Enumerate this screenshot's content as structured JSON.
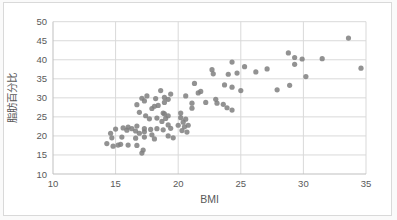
{
  "window": {
    "background": "#ffffff",
    "frame_border_color": "#d9d9d9"
  },
  "chart_data": {
    "type": "scatter",
    "title": "",
    "xlabel": "BMI",
    "ylabel": "脂肪百分比",
    "xlim": [
      10,
      35
    ],
    "ylim": [
      10,
      50
    ],
    "x_ticks": [
      10,
      15,
      20,
      25,
      30,
      35
    ],
    "y_ticks": [
      10,
      15,
      20,
      25,
      30,
      35,
      40,
      45,
      50
    ],
    "grid": true,
    "legend_position": "none",
    "marker": "circle",
    "point_color": "#7f7f7f",
    "gridline_color": "#d9d9d9",
    "axis_line_color": "#bfbfbf",
    "tick_label_color": "#595959",
    "axis_title_color": "#595959",
    "points": [
      [
        14.3,
        18.0
      ],
      [
        14.6,
        20.7
      ],
      [
        14.7,
        19.5
      ],
      [
        14.8,
        17.3
      ],
      [
        15.0,
        21.8
      ],
      [
        15.2,
        17.6
      ],
      [
        15.4,
        17.8
      ],
      [
        15.5,
        19.7
      ],
      [
        15.6,
        22.1
      ],
      [
        15.9,
        21.5
      ],
      [
        16.0,
        17.6
      ],
      [
        16.0,
        22.3
      ],
      [
        16.3,
        21.9
      ],
      [
        16.6,
        19.4
      ],
      [
        16.6,
        21.3
      ],
      [
        16.7,
        17.5
      ],
      [
        16.7,
        22.6
      ],
      [
        16.7,
        28.2
      ],
      [
        16.9,
        20.7
      ],
      [
        16.9,
        26.2
      ],
      [
        17.1,
        15.5
      ],
      [
        17.1,
        29.9
      ],
      [
        17.2,
        16.3
      ],
      [
        17.3,
        19.7
      ],
      [
        17.3,
        21.1
      ],
      [
        17.3,
        21.9
      ],
      [
        17.3,
        29.2
      ],
      [
        17.4,
        25.3
      ],
      [
        17.5,
        30.5
      ],
      [
        17.7,
        24.5
      ],
      [
        17.8,
        21.7
      ],
      [
        17.9,
        20.3
      ],
      [
        17.9,
        27.2
      ],
      [
        18.1,
        19.2
      ],
      [
        18.1,
        27.8
      ],
      [
        18.2,
        29.8
      ],
      [
        18.3,
        21.9
      ],
      [
        18.3,
        24.7
      ],
      [
        18.4,
        28.0
      ],
      [
        18.6,
        31.9
      ],
      [
        18.7,
        23.8
      ],
      [
        18.8,
        21.6
      ],
      [
        18.8,
        26.0
      ],
      [
        18.9,
        25.8
      ],
      [
        18.9,
        28.8
      ],
      [
        18.9,
        30.1
      ],
      [
        19.0,
        24.6
      ],
      [
        19.2,
        20.0
      ],
      [
        19.2,
        22.9
      ],
      [
        19.2,
        25.3
      ],
      [
        19.2,
        29.6
      ],
      [
        19.4,
        22.0
      ],
      [
        19.4,
        31.0
      ],
      [
        19.6,
        19.5
      ],
      [
        20.0,
        22.8
      ],
      [
        20.2,
        24.8
      ],
      [
        20.2,
        26.0
      ],
      [
        20.3,
        21.4
      ],
      [
        20.4,
        23.6
      ],
      [
        20.5,
        22.4
      ],
      [
        20.6,
        24.4
      ],
      [
        20.6,
        30.5
      ],
      [
        20.7,
        21.0
      ],
      [
        20.8,
        22.8
      ],
      [
        21.1,
        27.3
      ],
      [
        21.1,
        28.6
      ],
      [
        21.3,
        33.8
      ],
      [
        21.6,
        31.3
      ],
      [
        21.8,
        31.7
      ],
      [
        22.2,
        28.8
      ],
      [
        22.7,
        37.4
      ],
      [
        22.8,
        36.3
      ],
      [
        23.0,
        29.6
      ],
      [
        23.1,
        28.6
      ],
      [
        23.6,
        28.3
      ],
      [
        23.7,
        33.4
      ],
      [
        23.9,
        27.4
      ],
      [
        24.0,
        36.2
      ],
      [
        24.3,
        26.8
      ],
      [
        24.3,
        32.8
      ],
      [
        24.3,
        39.4
      ],
      [
        24.7,
        36.5
      ],
      [
        25.0,
        31.9
      ],
      [
        25.3,
        38.2
      ],
      [
        26.2,
        36.8
      ],
      [
        27.1,
        37.6
      ],
      [
        27.9,
        32.1
      ],
      [
        28.8,
        41.8
      ],
      [
        28.9,
        33.3
      ],
      [
        29.3,
        38.8
      ],
      [
        29.3,
        40.6
      ],
      [
        29.9,
        40.2
      ],
      [
        30.2,
        35.6
      ],
      [
        31.5,
        40.3
      ],
      [
        33.6,
        45.7
      ],
      [
        34.6,
        37.8
      ]
    ]
  }
}
